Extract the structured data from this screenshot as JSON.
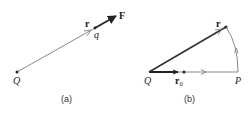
{
  "figure_a": {
    "caption": "(a)",
    "labels": {
      "source_charge": "Q",
      "test_charge": "q",
      "position_vector": "r",
      "force_vector": "F"
    }
  },
  "figure_b": {
    "caption": "(b)",
    "labels": {
      "source_charge": "Q",
      "position_vector": "r",
      "initial_position": "r",
      "initial_position_subscript": "0",
      "point": "P"
    }
  },
  "colors": {
    "thin_line": "#888888",
    "thick_vector": "#222222",
    "text": "#222222"
  }
}
